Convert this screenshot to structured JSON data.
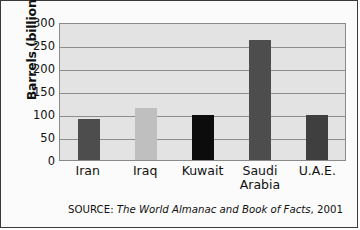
{
  "chart_data": {
    "type": "bar",
    "title": "",
    "xlabel": "",
    "ylabel": "Barrels (billions)",
    "categories": [
      "Iran",
      "Iraq",
      "Kuwait",
      "Saudi Arabia",
      "U.A.E."
    ],
    "values": [
      90,
      112,
      97,
      261,
      98
    ],
    "ylim": [
      0,
      300
    ],
    "yticks": [
      300,
      250,
      200,
      150,
      100,
      50,
      0
    ],
    "ytick_labels": [
      "300",
      "250",
      "200",
      "150",
      "100",
      "50",
      "0"
    ],
    "grid": true,
    "legend": "none",
    "bar_colors": [
      "#4d4d4d",
      "#bfbfbf",
      "#0c0c0c",
      "#4d4d4d",
      "#3f3f3f"
    ],
    "plot_background": "#e3e3e3",
    "category_label_lines": [
      [
        "Iran"
      ],
      [
        "Iraq"
      ],
      [
        "Kuwait"
      ],
      [
        "Saudi",
        "Arabia"
      ],
      [
        "U.A.E."
      ]
    ]
  },
  "source": {
    "prefix": "SOURCE: ",
    "title": "The World Almanac and Book of Facts",
    "suffix": ", 2001"
  }
}
